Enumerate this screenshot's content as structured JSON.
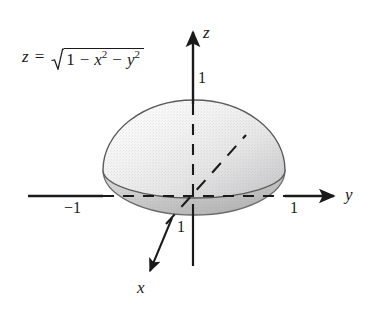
{
  "figure": {
    "kind": "3d-surface-sketch",
    "equation": {
      "lhs": "z",
      "relation": "=",
      "radicand_first": "1",
      "op1": "−",
      "term_x": "x",
      "exp_x": "2",
      "op2": "−",
      "term_y": "y",
      "exp_y": "2",
      "plain": "z = √(1 − x² − y²)"
    },
    "axes": [
      {
        "id": "z",
        "label": "z",
        "direction": "up"
      },
      {
        "id": "y",
        "label": "y",
        "direction": "right"
      },
      {
        "id": "x",
        "label": "x",
        "direction": "down-left"
      }
    ],
    "ticks": [
      {
        "id": "z-one",
        "label": "1",
        "axis": "z"
      },
      {
        "id": "y-one",
        "label": "1",
        "axis": "y"
      },
      {
        "id": "y-neg-one",
        "label": "−1",
        "axis": "y"
      },
      {
        "id": "x-one",
        "label": "1",
        "axis": "x"
      }
    ],
    "colors": {
      "ink": "#1a1a1a",
      "outline": "#555555",
      "dome_light": "#fbfbfb",
      "dome_mid": "#ececed",
      "dome_shadow": "#cfcfd0",
      "skirt_light": "#d8d8d9",
      "skirt_dark": "#b9b9ba",
      "background": "#ffffff"
    }
  }
}
